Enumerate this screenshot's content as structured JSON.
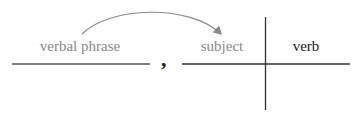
{
  "diagram": {
    "type": "sentence-diagram",
    "labels": {
      "modifier": "verbal phrase",
      "subject": "subject",
      "verb": "verb",
      "separator": ","
    },
    "colors": {
      "muted_text": "#8a8a8a",
      "dark_text": "#1a1a1a",
      "arrow": "#8a8a8a",
      "lines": "#333333"
    },
    "arrow": {
      "from": "verbal phrase",
      "to": "subject"
    }
  }
}
